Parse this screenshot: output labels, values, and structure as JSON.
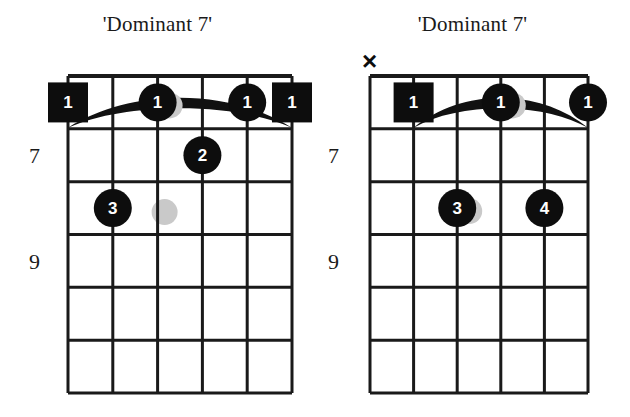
{
  "page": {
    "background_color": "#ffffff",
    "ink_color": "#111111",
    "width": 630,
    "height": 417
  },
  "diagrams": [
    {
      "id": "left",
      "title": "'Dominant 7'",
      "panel_x": 0,
      "grid": {
        "x": 68,
        "y": 76,
        "width": 224,
        "height": 317,
        "strings": 6,
        "frets": 6,
        "string_spacing": 44.8,
        "fret_spacing": 52.8,
        "line_color": "#1a1a1a",
        "line_width": 3
      },
      "fret_labels": [
        {
          "text": "7",
          "fret_index": 1,
          "x": 40,
          "y": 143
        },
        {
          "text": "9",
          "fret_index": 3,
          "x": 40,
          "y": 249
        }
      ],
      "open_mute_markers": [],
      "barre": {
        "present": true,
        "fret_index": 1,
        "from_string": 1,
        "to_string": 6,
        "color": "#111111",
        "style": "arc"
      },
      "markers": [
        {
          "finger": "1",
          "string": 6,
          "fret": 1,
          "shape": "square",
          "shadow": false
        },
        {
          "finger": "1",
          "string": 4,
          "fret": 1,
          "shape": "circle",
          "shadow": true
        },
        {
          "finger": "1",
          "string": 2,
          "fret": 1,
          "shape": "circle",
          "shadow": false
        },
        {
          "finger": "1",
          "string": 1,
          "fret": 1,
          "shape": "square",
          "shadow": false
        },
        {
          "finger": "2",
          "string": 3,
          "fret": 2,
          "shape": "circle",
          "shadow": false
        },
        {
          "finger": "3",
          "string": 5,
          "fret": 3,
          "shape": "circle",
          "shadow": false
        }
      ],
      "ghost_dots": [
        {
          "string": 4,
          "fret": 3,
          "color": "#c9c9c9"
        }
      ]
    },
    {
      "id": "right",
      "title": "'Dominant 7'",
      "panel_x": 315,
      "grid": {
        "x": 370,
        "y": 76,
        "width": 218,
        "height": 317,
        "strings": 6,
        "frets": 6,
        "string_spacing": 43.6,
        "fret_spacing": 52.8,
        "line_color": "#1a1a1a",
        "line_width": 3
      },
      "fret_labels": [
        {
          "text": "7",
          "fret_index": 1,
          "x": 339,
          "y": 143
        },
        {
          "text": "9",
          "fret_index": 3,
          "x": 339,
          "y": 249
        }
      ],
      "open_mute_markers": [
        {
          "symbol": "×",
          "name": "mute-x",
          "string": 6,
          "x": 362,
          "y": 48
        }
      ],
      "barre": {
        "present": true,
        "fret_index": 1,
        "from_string": 1,
        "to_string": 5,
        "color": "#111111",
        "style": "arc"
      },
      "markers": [
        {
          "finger": "1",
          "string": 5,
          "fret": 1,
          "shape": "square",
          "shadow": false
        },
        {
          "finger": "1",
          "string": 3,
          "fret": 1,
          "shape": "circle",
          "shadow": true
        },
        {
          "finger": "1",
          "string": 1,
          "fret": 1,
          "shape": "circle",
          "shadow": false
        },
        {
          "finger": "3",
          "string": 4,
          "fret": 3,
          "shape": "circle",
          "shadow": true
        },
        {
          "finger": "4",
          "string": 2,
          "fret": 3,
          "shape": "circle",
          "shadow": false
        }
      ],
      "ghost_dots": []
    }
  ]
}
